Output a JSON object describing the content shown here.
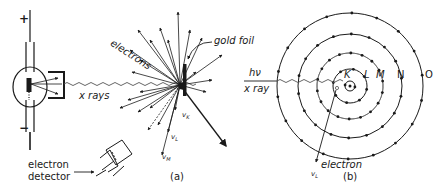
{
  "figure": {
    "panel_a": {
      "caption": "(a)",
      "labels": {
        "plus": "+",
        "minus": "−",
        "x_rays": "x rays",
        "electrons": "electrons",
        "gold_foil": "gold foil",
        "electron_detector_line1": "electron",
        "electron_detector_line2": "detector",
        "nu_K": "v",
        "nu_K_sub": "K",
        "nu_L": "v",
        "nu_L_sub": "L",
        "nu_M": "v",
        "nu_M_sub": "M"
      }
    },
    "panel_b": {
      "caption": "(b)",
      "labels": {
        "h_nu": "hν",
        "x_ray": "x ray",
        "electron": "electron",
        "nu_L": "v",
        "nu_L_sub": "L"
      },
      "shells": [
        "K",
        "L",
        "M",
        "N",
        "O"
      ]
    },
    "colors": {
      "ink": "#1a1a1a",
      "light_ink": "#555555",
      "background": "#ffffff"
    }
  }
}
